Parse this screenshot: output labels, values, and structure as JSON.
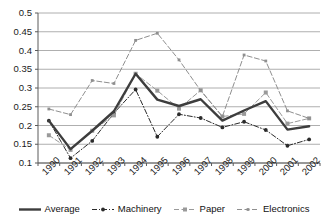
{
  "chart_data": {
    "type": "line",
    "title": "",
    "subtitle": "",
    "xlabel": "",
    "ylabel": "",
    "categories": [
      "1990",
      "1991",
      "1992",
      "1993",
      "1994",
      "1995",
      "1996",
      "1997",
      "1998",
      "1999",
      "2000",
      "2001",
      "2002"
    ],
    "ylim": [
      0.1,
      0.5
    ],
    "yticks": [
      0.1,
      0.15,
      0.2,
      0.25,
      0.3,
      0.35,
      0.4,
      0.45,
      0.5
    ],
    "ytick_labels": [
      "0.1",
      "0.15",
      "0.2",
      "0.25",
      "0.3",
      "0.35",
      "0.4",
      "0.45",
      "0.5"
    ],
    "grid": true,
    "grid_axis": "y",
    "legend_position": "bottom",
    "series": [
      {
        "name": "Average",
        "color": "#3d3d3d",
        "style": "solid",
        "marker": "none",
        "width": 2.4,
        "values": [
          0.213,
          0.137,
          0.186,
          0.238,
          0.338,
          0.269,
          0.252,
          0.27,
          0.213,
          0.24,
          0.265,
          0.189,
          0.198
        ]
      },
      {
        "name": "Machinery",
        "color": "#2b2b2b",
        "style": "dashdot",
        "marker": "circle",
        "width": 1,
        "values": [
          0.213,
          0.113,
          0.159,
          0.233,
          0.296,
          0.17,
          0.23,
          0.22,
          0.195,
          0.21,
          0.188,
          0.146,
          0.163
        ]
      },
      {
        "name": "Paper",
        "color": "#9a9a9a",
        "style": "dashed",
        "marker": "square",
        "width": 1,
        "values": [
          0.174,
          0.135,
          0.186,
          0.227,
          0.338,
          0.293,
          0.245,
          0.294,
          0.224,
          0.231,
          0.288,
          0.205,
          0.219
        ]
      },
      {
        "name": "Electronics",
        "color": "#8f8f8f",
        "style": "dashed",
        "marker": "tick",
        "width": 1,
        "values": [
          0.244,
          0.229,
          0.32,
          0.312,
          0.427,
          0.446,
          0.375,
          0.293,
          0.224,
          0.388,
          0.372,
          0.239,
          0.219
        ]
      }
    ]
  },
  "legend": {
    "items": [
      {
        "label": "Average"
      },
      {
        "label": "Machinery"
      },
      {
        "label": "Paper"
      },
      {
        "label": "Electronics"
      }
    ]
  }
}
